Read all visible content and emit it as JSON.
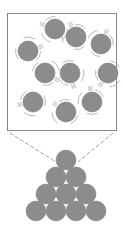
{
  "diagram": {
    "colors": {
      "particle": "#8c8c8c",
      "outline": "#777777",
      "motion_lines": "#9a9a9a",
      "box_border": "#888888",
      "background": "#ffffff"
    },
    "magnified_box": {
      "x": 7,
      "y": 13,
      "width": 109,
      "height": 117
    },
    "zoom_lines": [
      {
        "x1": 10,
        "y1": 133,
        "x2": 56,
        "y2": 162
      },
      {
        "x1": 113,
        "y1": 133,
        "x2": 78,
        "y2": 162
      }
    ],
    "particle_radius": 10,
    "moving_particles": [
      {
        "cx": 55,
        "cy": 29
      },
      {
        "cx": 76,
        "cy": 37
      },
      {
        "cx": 101,
        "cy": 44
      },
      {
        "cx": 28,
        "cy": 51
      },
      {
        "cx": 45,
        "cy": 73
      },
      {
        "cx": 70,
        "cy": 73
      },
      {
        "cx": 108,
        "cy": 73
      },
      {
        "cx": 33,
        "cy": 102
      },
      {
        "cx": 66,
        "cy": 112
      },
      {
        "cx": 92,
        "cy": 102
      }
    ],
    "stacked_particles": [
      {
        "cx": 66,
        "cy": 160
      },
      {
        "cx": 56,
        "cy": 177
      },
      {
        "cx": 76,
        "cy": 177
      },
      {
        "cx": 46,
        "cy": 194
      },
      {
        "cx": 66,
        "cy": 194
      },
      {
        "cx": 86,
        "cy": 194
      },
      {
        "cx": 36,
        "cy": 211
      },
      {
        "cx": 56,
        "cy": 211
      },
      {
        "cx": 76,
        "cy": 211
      },
      {
        "cx": 96,
        "cy": 211
      }
    ]
  }
}
